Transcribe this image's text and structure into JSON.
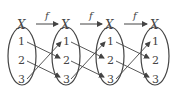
{
  "diagram": {
    "set_label": "X",
    "function_label": "f",
    "elements": [
      "1",
      "2",
      "3"
    ],
    "sets": [
      {
        "cx": 22,
        "label": "X"
      },
      {
        "cx": 66,
        "label": "X"
      },
      {
        "cx": 110,
        "label": "X"
      },
      {
        "cx": 155,
        "label": "X"
      }
    ],
    "mapping": {
      "1": "2",
      "2": "3",
      "3": "1"
    },
    "stroke_color": "#444444"
  }
}
